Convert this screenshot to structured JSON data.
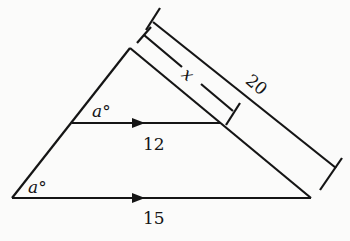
{
  "diagram": {
    "type": "similar-triangles",
    "labels": {
      "top_segment": "12",
      "base_segment": "15",
      "side_x": "x",
      "side_total": "20",
      "angle_top": "a°",
      "angle_bottom": "a°"
    },
    "colors": {
      "stroke": "#151515",
      "background": "#fbfbfa"
    }
  }
}
